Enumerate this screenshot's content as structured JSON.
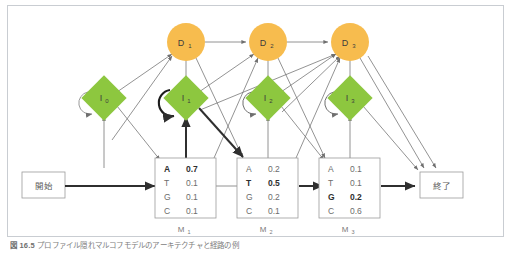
{
  "figure": {
    "caption_number": "図 16.5",
    "caption_text": "プロファイル隠れマルコフモデルのアーキテクチャと経路の例",
    "border_color": "#c9cdd2",
    "background": "#ffffff"
  },
  "colors": {
    "delete_state_fill": "#f7bc4e",
    "insert_state_fill": "#8dc73f",
    "match_box_fill": "#ffffff",
    "match_box_stroke": "#9b9b9b",
    "arrow_color": "#6f6f6f",
    "bold_arrow_color": "#2f2f2f",
    "text_color": "#6d6d6d",
    "bold_text_color": "#2f2f2f"
  },
  "terminals": {
    "start": {
      "label": "開始",
      "name": "start-node"
    },
    "end": {
      "label": "終了",
      "name": "end-node"
    }
  },
  "delete_states": [
    {
      "id": "D1",
      "label": "D",
      "sub": "1"
    },
    {
      "id": "D2",
      "label": "D",
      "sub": "2"
    },
    {
      "id": "D3",
      "label": "D",
      "sub": "3"
    }
  ],
  "insert_states": [
    {
      "id": "I0",
      "label": "I",
      "sub": "0",
      "self_loop": "normal"
    },
    {
      "id": "I1",
      "label": "I",
      "sub": "1",
      "self_loop": "bold"
    },
    {
      "id": "I2",
      "label": "I",
      "sub": "2",
      "self_loop": "normal"
    },
    {
      "id": "I3",
      "label": "I",
      "sub": "3",
      "self_loop": "normal"
    }
  ],
  "match_states": [
    {
      "id": "M1",
      "label": "M",
      "sub": "1",
      "rows": [
        {
          "symbol": "A",
          "value": "0.7",
          "bold": true
        },
        {
          "symbol": "T",
          "value": "0.1",
          "bold": false
        },
        {
          "symbol": "G",
          "value": "0.1",
          "bold": false
        },
        {
          "symbol": "C",
          "value": "0.1",
          "bold": false
        }
      ]
    },
    {
      "id": "M2",
      "label": "M",
      "sub": "2",
      "rows": [
        {
          "symbol": "A",
          "value": "0.2",
          "bold": false
        },
        {
          "symbol": "T",
          "value": "0.5",
          "bold": true
        },
        {
          "symbol": "G",
          "value": "0.2",
          "bold": false
        },
        {
          "symbol": "C",
          "value": "0.1",
          "bold": false
        }
      ]
    },
    {
      "id": "M3",
      "label": "M",
      "sub": "3",
      "rows": [
        {
          "symbol": "A",
          "value": "0.1",
          "bold": false
        },
        {
          "symbol": "T",
          "value": "0.1",
          "bold": false
        },
        {
          "symbol": "G",
          "value": "0.2",
          "bold": true
        },
        {
          "symbol": "C",
          "value": "0.6",
          "bold": false
        }
      ]
    }
  ],
  "highlighted_path": {
    "description": "開始 → M1 → I1 → I1 → M2 → M3 → 終了"
  }
}
